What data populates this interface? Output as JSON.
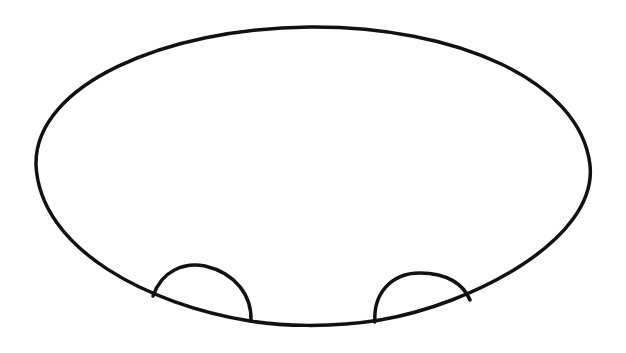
{
  "drawing": {
    "description": "Hand-drawn black outline: large horizontal ellipse with two small dome shapes along its bottom edge",
    "stroke_color": "#111111",
    "background_color": "#ffffff",
    "shapes": [
      {
        "name": "ellipse-outline",
        "cx": 313,
        "cy": 176,
        "rx": 277,
        "ry": 149
      },
      {
        "name": "left-dome",
        "x_start": 153,
        "x_end": 252,
        "peak_y": 265
      },
      {
        "name": "right-dome",
        "x_start": 375,
        "x_end": 470,
        "peak_y": 273
      }
    ]
  }
}
